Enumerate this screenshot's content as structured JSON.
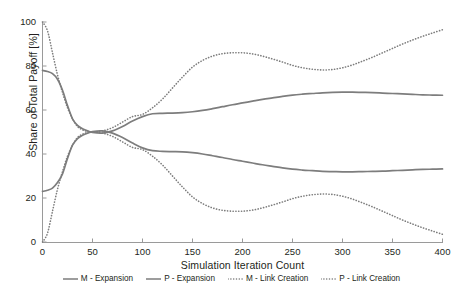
{
  "chart_data": {
    "type": "line",
    "title": "",
    "xlabel": "Simulation Iteration Count",
    "ylabel": "Share of Total Payoff [%]",
    "xlim": [
      0,
      400
    ],
    "ylim": [
      0,
      100
    ],
    "xticks": [
      "0",
      "50",
      "100",
      "150",
      "200",
      "250",
      "300",
      "350",
      "400"
    ],
    "xtick_values": [
      0,
      50,
      100,
      150,
      200,
      250,
      300,
      350,
      400
    ],
    "yticks": [
      "0",
      "20",
      "40",
      "60",
      "80",
      "100"
    ],
    "ytick_values": [
      0,
      20,
      40,
      60,
      80,
      100
    ],
    "grid": false,
    "legend_position": "bottom",
    "line_color": "#7d7d7d",
    "x": [
      0,
      5,
      10,
      15,
      20,
      25,
      30,
      35,
      40,
      45,
      50,
      60,
      70,
      80,
      90,
      100,
      110,
      120,
      130,
      140,
      150,
      160,
      170,
      180,
      190,
      200,
      210,
      220,
      230,
      240,
      250,
      260,
      270,
      280,
      290,
      300,
      310,
      320,
      330,
      340,
      350,
      360,
      370,
      380,
      390,
      400
    ],
    "series": [
      {
        "name": "M - Expansion",
        "style": "solid",
        "color": "#7d7d7d",
        "values": [
          78,
          77.5,
          76.5,
          74,
          69,
          62,
          56,
          53,
          51.5,
          50.5,
          49.8,
          49.5,
          50.5,
          52.5,
          55,
          57,
          58.3,
          58.5,
          58.6,
          58.8,
          59.2,
          59.8,
          60.6,
          61.5,
          62.4,
          63.2,
          64,
          64.8,
          65.5,
          66.2,
          66.8,
          67.2,
          67.5,
          67.8,
          68,
          68.1,
          68.1,
          68,
          67.9,
          67.7,
          67.5,
          67.3,
          67.1,
          66.9,
          66.8,
          66.7
        ]
      },
      {
        "name": "P - Expansion",
        "style": "solid",
        "color": "#7d7d7d",
        "values": [
          23,
          23.5,
          24.5,
          27,
          31,
          38,
          44,
          47,
          48.5,
          49.5,
          50.2,
          50.5,
          49.5,
          47.5,
          45,
          42.8,
          41.5,
          41.2,
          41.1,
          41,
          40.6,
          40,
          39.2,
          38.4,
          37.5,
          36.7,
          35.9,
          35.1,
          34.4,
          33.7,
          33.1,
          32.7,
          32.4,
          32.1,
          32,
          31.9,
          31.9,
          32,
          32.1,
          32.2,
          32.4,
          32.6,
          32.8,
          33,
          33.1,
          33.2
        ]
      },
      {
        "name": "M - Link Creation",
        "style": "dotted",
        "color": "#7d7d7d",
        "values": [
          100,
          96,
          86,
          76,
          68,
          61,
          56,
          52.5,
          51,
          50.3,
          50,
          50.5,
          52,
          54.5,
          57,
          58,
          61,
          65,
          70,
          75,
          79.5,
          82.5,
          84.5,
          85.6,
          86,
          86,
          85.5,
          84.5,
          83.2,
          81.8,
          80.3,
          79.2,
          78.5,
          78.2,
          78.4,
          79.2,
          80.5,
          82.2,
          84,
          86,
          88,
          90,
          91.8,
          93.5,
          95,
          96.5
        ]
      },
      {
        "name": "P - Link Creation",
        "style": "dotted",
        "color": "#7d7d7d",
        "values": [
          0,
          4,
          14,
          24,
          32,
          39,
          44,
          47.5,
          49,
          49.7,
          50,
          49.5,
          48,
          45.5,
          43,
          42,
          39,
          35,
          30,
          25,
          20.5,
          17.5,
          15.5,
          14.4,
          14,
          14,
          14.5,
          15.5,
          16.8,
          18.2,
          19.7,
          20.8,
          21.5,
          21.8,
          21.6,
          20.8,
          19.5,
          17.8,
          16,
          14,
          12,
          10,
          8.2,
          6.5,
          5,
          3.5
        ]
      }
    ],
    "legend": [
      {
        "label": "M - Expansion",
        "style": "solid",
        "color": "#7d7d7d"
      },
      {
        "label": "P - Expansion",
        "style": "solid",
        "color": "#7d7d7d"
      },
      {
        "label": "M - Link Creation",
        "style": "dotted",
        "color": "#7d7d7d"
      },
      {
        "label": "P - Link Creation",
        "style": "dotted",
        "color": "#7d7d7d"
      }
    ]
  }
}
